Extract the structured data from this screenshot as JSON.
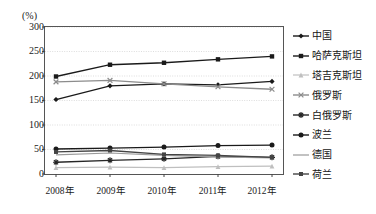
{
  "chart_data": {
    "type": "line",
    "title": "",
    "unit_label": "(%)",
    "xlabel": "",
    "ylabel": "",
    "categories": [
      "2008年",
      "2009年",
      "2010年",
      "2011年",
      "2012年"
    ],
    "ylim": [
      0,
      300
    ],
    "yticks": [
      0,
      50,
      100,
      150,
      200,
      250,
      300
    ],
    "grid": true,
    "legend_position": "right",
    "series": [
      {
        "name": "中国",
        "marker": "diamond",
        "color": "#1a1a1a",
        "values": [
          152,
          180,
          184,
          182,
          189
        ]
      },
      {
        "name": "哈萨克斯坦",
        "marker": "square",
        "color": "#1a1a1a",
        "values": [
          199,
          223,
          227,
          234,
          240
        ]
      },
      {
        "name": "塔吉克斯坦",
        "marker": "triangle",
        "color": "#bfbfbf",
        "values": [
          13,
          14,
          13,
          15,
          16
        ]
      },
      {
        "name": "俄罗斯",
        "marker": "cross",
        "color": "#8c8c8c",
        "values": [
          188,
          191,
          184,
          178,
          173
        ]
      },
      {
        "name": "白俄罗斯",
        "marker": "star",
        "color": "#262626",
        "values": [
          24,
          28,
          31,
          36,
          34
        ]
      },
      {
        "name": "波兰",
        "marker": "circle",
        "color": "#1a1a1a",
        "values": [
          51,
          53,
          55,
          58,
          59
        ]
      },
      {
        "name": "德国",
        "marker": "line",
        "color": "#9a9a9a",
        "values": [
          39,
          43,
          38,
          35,
          33
        ]
      },
      {
        "name": "荷兰",
        "marker": "small-square",
        "color": "#444444",
        "values": [
          45,
          48,
          40,
          38,
          34
        ]
      }
    ]
  }
}
